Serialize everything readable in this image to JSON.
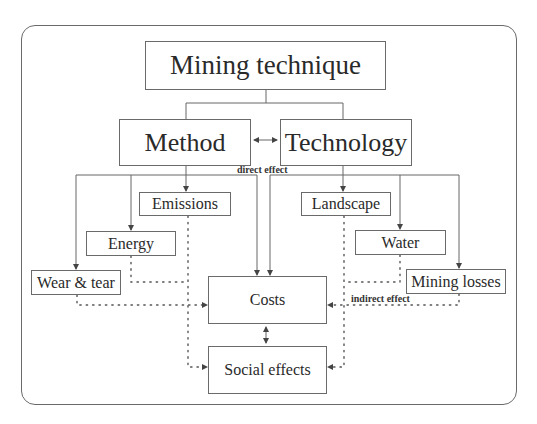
{
  "diagram": {
    "nodes": {
      "mining_technique": "Mining technique",
      "method": "Method",
      "technology": "Technology",
      "emissions": "Emissions",
      "energy": "Energy",
      "wear_tear": "Wear & tear",
      "landscape": "Landscape",
      "water": "Water",
      "mining_losses": "Mining losses",
      "costs": "Costs",
      "social_effects": "Social effects"
    },
    "labels": {
      "direct_effect": "direct effect",
      "indirect_effect": "indirect effect"
    },
    "edges": [
      {
        "from": "Mining technique",
        "to": "Method",
        "style": "solid"
      },
      {
        "from": "Mining technique",
        "to": "Technology",
        "style": "solid"
      },
      {
        "from": "Method",
        "to": "Technology",
        "style": "solid",
        "bidirectional": true
      },
      {
        "from": "Method",
        "to": "Emissions",
        "style": "solid"
      },
      {
        "from": "Method",
        "to": "Energy",
        "style": "solid"
      },
      {
        "from": "Method",
        "to": "Wear & tear",
        "style": "solid"
      },
      {
        "from": "Method",
        "to": "Costs",
        "style": "solid",
        "label": "direct effect"
      },
      {
        "from": "Technology",
        "to": "Landscape",
        "style": "solid"
      },
      {
        "from": "Technology",
        "to": "Water",
        "style": "solid"
      },
      {
        "from": "Technology",
        "to": "Mining losses",
        "style": "solid"
      },
      {
        "from": "Technology",
        "to": "Costs",
        "style": "solid",
        "label": "direct effect"
      },
      {
        "from": "Emissions",
        "to": "Social effects",
        "style": "dotted"
      },
      {
        "from": "Energy",
        "to": "Costs",
        "style": "dotted"
      },
      {
        "from": "Wear & tear",
        "to": "Costs",
        "style": "dotted"
      },
      {
        "from": "Landscape",
        "to": "Social effects",
        "style": "dotted"
      },
      {
        "from": "Water",
        "to": "Costs",
        "style": "dotted"
      },
      {
        "from": "Mining losses",
        "to": "Costs",
        "style": "dotted",
        "label": "indirect effect"
      },
      {
        "from": "Costs",
        "to": "Social effects",
        "style": "solid",
        "bidirectional": true
      }
    ]
  }
}
